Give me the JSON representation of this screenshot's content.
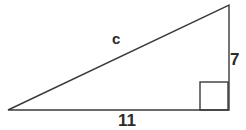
{
  "figure": {
    "type": "right-triangle-diagram",
    "background_color": "#ffffff",
    "stroke_color": "#3a3a3a",
    "label_color": "#2b2b2b",
    "labels": {
      "hypotenuse": "c",
      "vertical_leg": "7",
      "base_leg": "11"
    },
    "vertices": {
      "left": {
        "x": 8,
        "y": 110
      },
      "bottom_right": {
        "x": 229,
        "y": 110
      },
      "top_right": {
        "x": 229,
        "y": 5
      }
    },
    "right_angle_marker": {
      "x": 200,
      "y": 82,
      "size": 28
    }
  }
}
